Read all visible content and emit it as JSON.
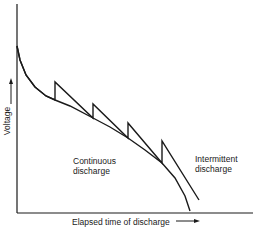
{
  "chart_data": {
    "type": "line",
    "title": "",
    "xlabel": "Elapsed time of discharge",
    "ylabel": "Voltage",
    "xticks": [],
    "yticks": [],
    "grid": false,
    "legend": "none (curves labeled inline)",
    "series": [
      {
        "name": "Continuous discharge",
        "label_lines": [
          "Continuous",
          "discharge"
        ],
        "points_px": [
          [
            17,
            46
          ],
          [
            20,
            60
          ],
          [
            26,
            75
          ],
          [
            35,
            87
          ],
          [
            46,
            96
          ],
          [
            55,
            100
          ],
          [
            70,
            106
          ],
          [
            93,
            118
          ],
          [
            110,
            127
          ],
          [
            128,
            138
          ],
          [
            145,
            150
          ],
          [
            162,
            163
          ],
          [
            175,
            178
          ],
          [
            185,
            196
          ],
          [
            190,
            211
          ]
        ]
      },
      {
        "name": "Intermittent discharge",
        "label_lines": [
          "Intermittent",
          "discharge"
        ],
        "points_px": [
          [
            17,
            46
          ],
          [
            20,
            60
          ],
          [
            26,
            75
          ],
          [
            35,
            87
          ],
          [
            46,
            96
          ],
          [
            55,
            100
          ],
          [
            55,
            82
          ],
          [
            93,
            118
          ],
          [
            93,
            104
          ],
          [
            128,
            138
          ],
          [
            128,
            123
          ],
          [
            162,
            163
          ],
          [
            162,
            141
          ],
          [
            199,
            200
          ]
        ]
      }
    ]
  },
  "labels": {
    "continuous_line1": "Continuous",
    "continuous_line2": "discharge",
    "intermittent_line1": "Intermittent",
    "intermittent_line2": "discharge",
    "xlabel": "Elapsed time of discharge",
    "ylabel": "Voltage"
  }
}
